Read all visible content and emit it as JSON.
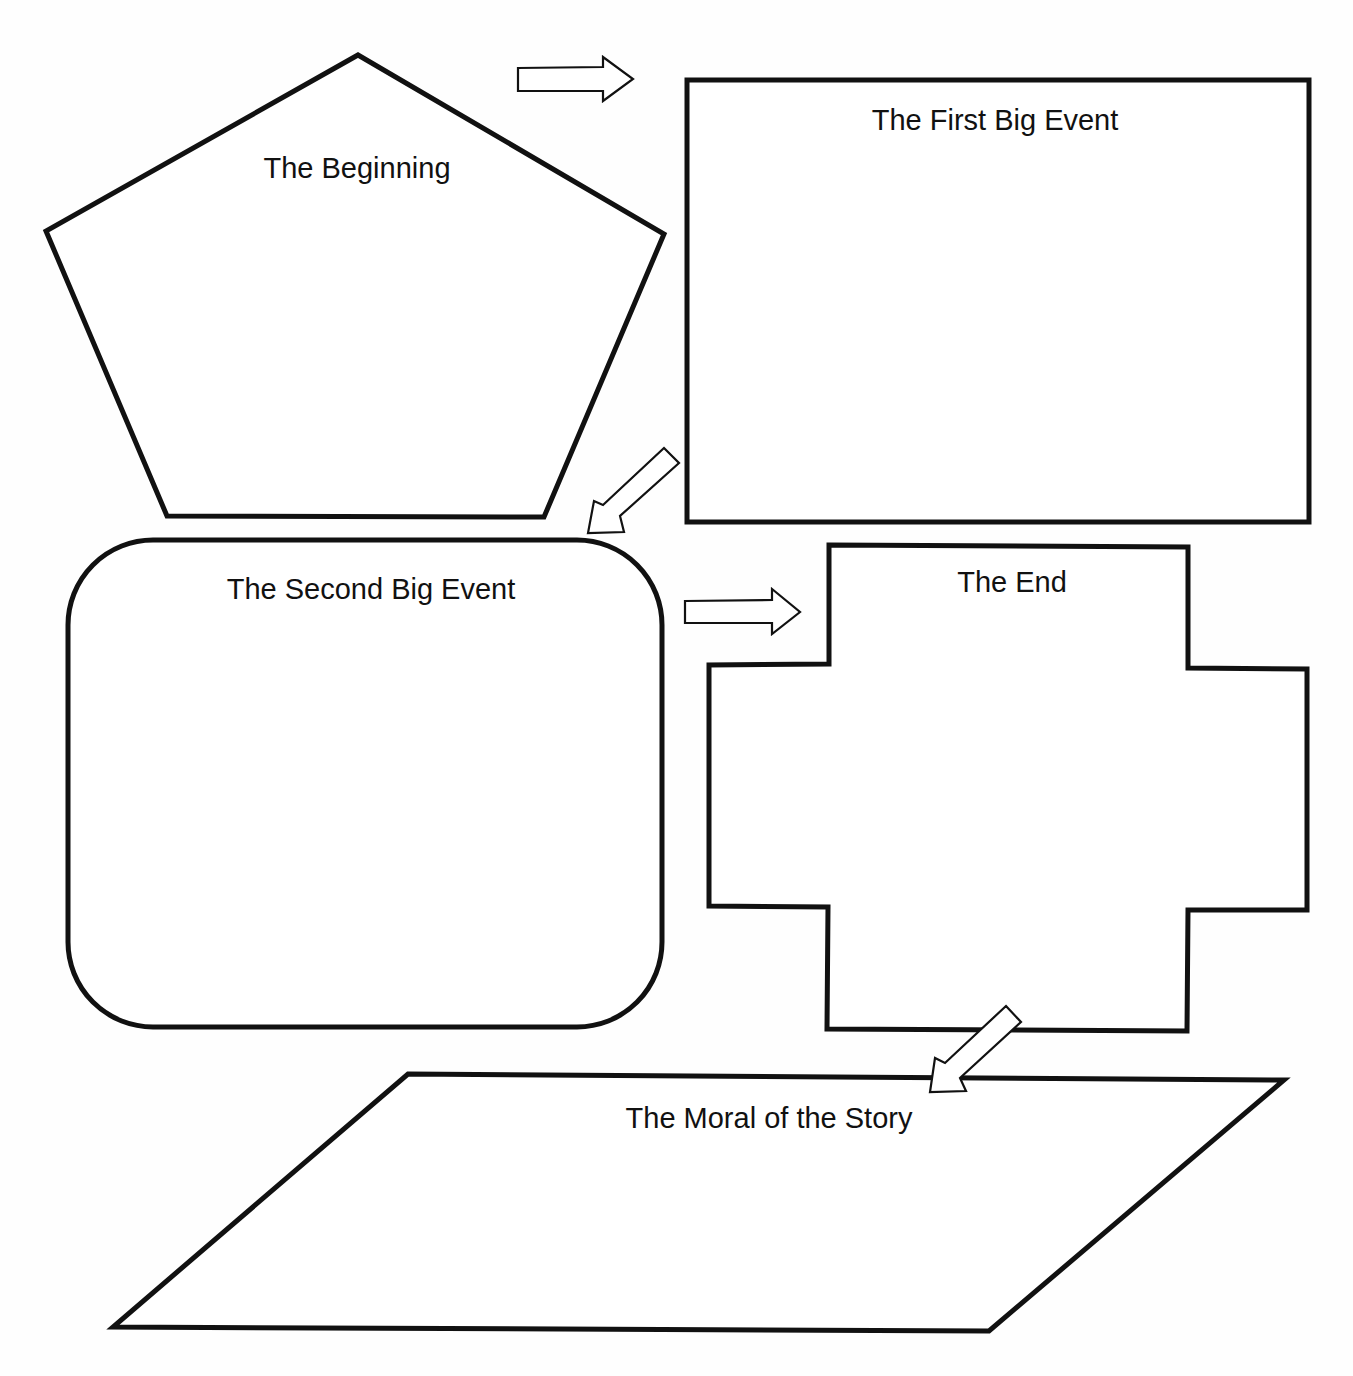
{
  "diagram": {
    "boxes": [
      {
        "id": "beginning",
        "label": "The Beginning",
        "shape": "pentagon"
      },
      {
        "id": "first_event",
        "label": "The First Big Event",
        "shape": "rectangle"
      },
      {
        "id": "second_event",
        "label": "The Second Big Event",
        "shape": "rounded-rectangle"
      },
      {
        "id": "end",
        "label": "The End",
        "shape": "cross"
      },
      {
        "id": "moral",
        "label": "The Moral of the Story",
        "shape": "parallelogram"
      }
    ],
    "arrows": [
      {
        "from": "beginning",
        "to": "first_event",
        "direction": "right"
      },
      {
        "from": "first_event",
        "to": "second_event",
        "direction": "down-left"
      },
      {
        "from": "second_event",
        "to": "end",
        "direction": "right"
      },
      {
        "from": "end",
        "to": "moral",
        "direction": "down-left"
      }
    ],
    "colors": {
      "stroke": "#111111",
      "fill": "#ffffff"
    }
  }
}
